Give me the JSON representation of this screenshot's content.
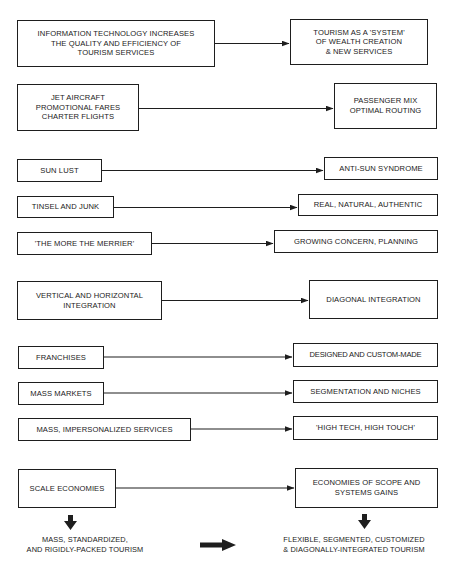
{
  "diagram": {
    "rows": [
      {
        "from": "INFORMATION TECHNOLOGY INCREASES\nTHE QUALITY AND EFFICIENCY OF\nTOURISM SERVICES",
        "to": "TOURISM AS A 'SYSTEM'\nOF WEALTH CREATION\n& NEW SERVICES"
      },
      {
        "from": "JET AIRCRAFT\nPROMOTIONAL FARES\nCHARTER FLIGHTS",
        "to": "PASSENGER MIX\nOPTIMAL ROUTING"
      },
      {
        "from": "SUN LUST",
        "to": "ANTI-SUN SYNDROME"
      },
      {
        "from": "TINSEL AND JUNK",
        "to": "REAL, NATURAL, AUTHENTIC"
      },
      {
        "from": "'THE MORE THE MERRIER'",
        "to": "GROWING CONCERN, PLANNING"
      },
      {
        "from": "VERTICAL AND HORIZONTAL\nINTEGRATION",
        "to": "DIAGONAL INTEGRATION"
      },
      {
        "from": "FRANCHISES",
        "to": "DESIGNED AND CUSTOM-MADE"
      },
      {
        "from": "MASS MARKETS",
        "to": "SEGMENTATION AND NICHES"
      },
      {
        "from": "MASS, IMPERSONALIZED SERVICES",
        "to": "'HIGH TECH, HIGH TOUCH'"
      },
      {
        "from": "SCALE ECONOMIES",
        "to": "ECONOMIES OF SCOPE AND\nSYSTEMS GAINS"
      }
    ],
    "outcomes": {
      "old": "MASS, STANDARDIZED,\nAND RIGIDLY-PACKED TOURISM",
      "new": "FLEXIBLE, SEGMENTED, CUSTOMIZED\n& DIAGONALLY-INTEGRATED TOURISM"
    },
    "colors": {
      "line": "#1e1e1e",
      "background": "#ffffff",
      "text": "#1a1a1a"
    }
  }
}
